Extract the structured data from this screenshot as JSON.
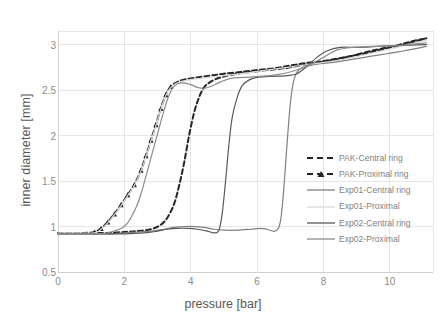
{
  "chart_data": {
    "type": "line",
    "title": "",
    "xlabel": "pressure [bar]",
    "ylabel": "inner diameter [mm]",
    "xlim": [
      0,
      11.3
    ],
    "ylim": [
      0.5,
      3.15
    ],
    "xticks": [
      0,
      2,
      4,
      6,
      8,
      10
    ],
    "xticklabels": [
      "0",
      "2",
      "4",
      "6",
      "8",
      "10"
    ],
    "yticks": [
      0.5,
      1,
      1.5,
      2,
      2.5,
      3
    ],
    "yticklabels": [
      "0.5",
      "1",
      "1.5",
      "2",
      "2.5",
      "3"
    ],
    "grid": true,
    "grid_axis": "both",
    "legend_position": "right-inside",
    "series": [
      {
        "name": "PAK-Central ring",
        "style": "dashed",
        "marker": "none",
        "color": "#262626",
        "points": [
          [
            0.0,
            0.93
          ],
          [
            0.5,
            0.93
          ],
          [
            1.0,
            0.93
          ],
          [
            1.5,
            0.93
          ],
          [
            2.0,
            0.94
          ],
          [
            2.4,
            0.95
          ],
          [
            2.8,
            0.97
          ],
          [
            3.1,
            1.02
          ],
          [
            3.3,
            1.1
          ],
          [
            3.5,
            1.25
          ],
          [
            3.65,
            1.45
          ],
          [
            3.8,
            1.7
          ],
          [
            3.95,
            2.0
          ],
          [
            4.1,
            2.25
          ],
          [
            4.25,
            2.42
          ],
          [
            4.4,
            2.53
          ],
          [
            4.55,
            2.58
          ],
          [
            4.75,
            2.62
          ],
          [
            5.0,
            2.65
          ],
          [
            5.4,
            2.68
          ],
          [
            5.8,
            2.7
          ],
          [
            6.3,
            2.72
          ],
          [
            6.8,
            2.74
          ],
          [
            7.3,
            2.77
          ],
          [
            7.8,
            2.8
          ],
          [
            8.3,
            2.83
          ],
          [
            8.8,
            2.87
          ],
          [
            9.3,
            2.92
          ],
          [
            9.8,
            2.96
          ],
          [
            10.3,
            3.0
          ],
          [
            10.7,
            3.04
          ],
          [
            11.1,
            3.07
          ]
        ]
      },
      {
        "name": "PAK-Proximal ring",
        "style": "dashed",
        "marker": "triangle",
        "color": "#262626",
        "points": [
          [
            0.0,
            0.93
          ],
          [
            0.4,
            0.93
          ],
          [
            0.8,
            0.93
          ],
          [
            1.1,
            0.94
          ],
          [
            1.3,
            0.98
          ],
          [
            1.5,
            1.05
          ],
          [
            1.7,
            1.14
          ],
          [
            1.9,
            1.24
          ],
          [
            2.1,
            1.35
          ],
          [
            2.3,
            1.46
          ],
          [
            2.5,
            1.62
          ],
          [
            2.65,
            1.78
          ],
          [
            2.8,
            1.95
          ],
          [
            2.95,
            2.12
          ],
          [
            3.1,
            2.3
          ],
          [
            3.25,
            2.45
          ],
          [
            3.4,
            2.54
          ],
          [
            3.6,
            2.59
          ],
          [
            3.85,
            2.62
          ],
          [
            4.2,
            2.64
          ],
          [
            4.6,
            2.66
          ],
          [
            5.0,
            2.68
          ],
          [
            5.5,
            2.7
          ],
          [
            6.0,
            2.72
          ],
          [
            6.5,
            2.74
          ],
          [
            7.0,
            2.77
          ],
          [
            7.5,
            2.8
          ],
          [
            8.0,
            2.82
          ],
          [
            8.6,
            2.86
          ],
          [
            9.2,
            2.9
          ],
          [
            9.8,
            2.95
          ],
          [
            10.4,
            3.0
          ],
          [
            11.1,
            3.07
          ]
        ]
      },
      {
        "name": "Exp01-Central ring",
        "style": "solid",
        "marker": "none",
        "color": "#808080",
        "points": [
          [
            0.0,
            0.92
          ],
          [
            1.0,
            0.92
          ],
          [
            1.6,
            0.92
          ],
          [
            2.0,
            0.93
          ],
          [
            2.4,
            0.94
          ],
          [
            2.8,
            0.95
          ],
          [
            3.2,
            0.97
          ],
          [
            3.5,
            0.99
          ],
          [
            3.8,
            1.0
          ],
          [
            4.1,
            1.0
          ],
          [
            4.4,
            0.99
          ],
          [
            4.7,
            0.97
          ],
          [
            5.0,
            0.96
          ],
          [
            5.4,
            0.96
          ],
          [
            5.8,
            0.97
          ],
          [
            6.1,
            0.98
          ],
          [
            6.3,
            0.97
          ],
          [
            6.55,
            0.95
          ],
          [
            6.7,
            1.05
          ],
          [
            6.8,
            1.4
          ],
          [
            6.9,
            1.9
          ],
          [
            7.0,
            2.35
          ],
          [
            7.1,
            2.6
          ],
          [
            7.25,
            2.72
          ],
          [
            7.5,
            2.76
          ],
          [
            7.9,
            2.79
          ],
          [
            8.4,
            2.81
          ],
          [
            8.9,
            2.84
          ],
          [
            9.4,
            2.87
          ],
          [
            9.9,
            2.9
          ],
          [
            10.4,
            2.93
          ],
          [
            11.1,
            2.98
          ]
        ]
      },
      {
        "name": "Exp01-Proximal",
        "style": "solid",
        "marker": "none",
        "color": "#d9d9d9",
        "points": [
          [
            0.0,
            0.93
          ],
          [
            0.6,
            0.93
          ],
          [
            1.1,
            0.93
          ],
          [
            1.3,
            0.97
          ],
          [
            1.5,
            1.04
          ],
          [
            1.7,
            1.13
          ],
          [
            1.9,
            1.23
          ],
          [
            2.1,
            1.34
          ],
          [
            2.3,
            1.45
          ],
          [
            2.5,
            1.61
          ],
          [
            2.65,
            1.77
          ],
          [
            2.8,
            1.94
          ],
          [
            2.95,
            2.11
          ],
          [
            3.1,
            2.29
          ],
          [
            3.25,
            2.44
          ],
          [
            3.4,
            2.53
          ],
          [
            3.6,
            2.58
          ],
          [
            3.9,
            2.61
          ],
          [
            4.3,
            2.63
          ],
          [
            4.8,
            2.65
          ],
          [
            5.3,
            2.67
          ],
          [
            5.9,
            2.7
          ],
          [
            6.5,
            2.73
          ],
          [
            7.1,
            2.76
          ],
          [
            7.7,
            2.79
          ],
          [
            8.3,
            2.82
          ],
          [
            8.9,
            2.86
          ],
          [
            9.5,
            2.91
          ],
          [
            10.2,
            2.97
          ],
          [
            11.1,
            3.05
          ]
        ]
      },
      {
        "name": "Exp02-Central ring",
        "style": "solid",
        "marker": "none",
        "color": "#595959",
        "points": [
          [
            0.0,
            0.92
          ],
          [
            1.0,
            0.92
          ],
          [
            2.0,
            0.92
          ],
          [
            2.6,
            0.93
          ],
          [
            3.0,
            0.95
          ],
          [
            3.3,
            0.97
          ],
          [
            3.6,
            0.98
          ],
          [
            3.9,
            0.98
          ],
          [
            4.2,
            0.97
          ],
          [
            4.5,
            0.95
          ],
          [
            4.7,
            0.93
          ],
          [
            4.85,
            0.96
          ],
          [
            4.95,
            1.15
          ],
          [
            5.05,
            1.5
          ],
          [
            5.15,
            1.9
          ],
          [
            5.25,
            2.2
          ],
          [
            5.4,
            2.42
          ],
          [
            5.55,
            2.55
          ],
          [
            5.75,
            2.61
          ],
          [
            6.0,
            2.64
          ],
          [
            6.4,
            2.65
          ],
          [
            6.9,
            2.66
          ],
          [
            7.2,
            2.68
          ],
          [
            7.5,
            2.76
          ],
          [
            7.8,
            2.86
          ],
          [
            8.1,
            2.93
          ],
          [
            8.5,
            2.97
          ],
          [
            9.0,
            2.97
          ],
          [
            9.6,
            2.98
          ],
          [
            10.2,
            2.99
          ],
          [
            11.1,
            3.0
          ]
        ]
      },
      {
        "name": "Exp02-Proximal",
        "style": "solid",
        "marker": "none",
        "color": "#8c8c8c",
        "points": [
          [
            0.0,
            0.92
          ],
          [
            1.2,
            0.92
          ],
          [
            1.6,
            0.94
          ],
          [
            2.0,
            1.0
          ],
          [
            2.2,
            1.1
          ],
          [
            2.4,
            1.25
          ],
          [
            2.55,
            1.42
          ],
          [
            2.7,
            1.62
          ],
          [
            2.85,
            1.82
          ],
          [
            3.0,
            2.02
          ],
          [
            3.15,
            2.22
          ],
          [
            3.3,
            2.4
          ],
          [
            3.45,
            2.52
          ],
          [
            3.6,
            2.57
          ],
          [
            3.8,
            2.58
          ],
          [
            4.0,
            2.56
          ],
          [
            4.2,
            2.53
          ],
          [
            4.4,
            2.52
          ],
          [
            4.6,
            2.54
          ],
          [
            4.9,
            2.59
          ],
          [
            5.2,
            2.63
          ],
          [
            5.6,
            2.64
          ],
          [
            6.1,
            2.65
          ],
          [
            6.6,
            2.67
          ],
          [
            7.1,
            2.71
          ],
          [
            7.6,
            2.78
          ],
          [
            8.0,
            2.86
          ],
          [
            8.4,
            2.94
          ],
          [
            8.9,
            2.97
          ],
          [
            9.5,
            2.98
          ],
          [
            10.2,
            2.99
          ],
          [
            11.1,
            3.02
          ]
        ]
      }
    ]
  },
  "legend": {
    "items": [
      {
        "label": "PAK-Central ring",
        "style": "dashed",
        "marker": "none",
        "color": "#262626"
      },
      {
        "label": "PAK-Proximal ring",
        "style": "dashed",
        "marker": "triangle",
        "color": "#262626"
      },
      {
        "label": "Exp01-Central ring",
        "style": "solid",
        "marker": "none",
        "color": "#808080"
      },
      {
        "label": "Exp01-Proximal",
        "style": "solid",
        "marker": "none",
        "color": "#d9d9d9"
      },
      {
        "label": "Exp02-Central ring",
        "style": "solid",
        "marker": "none",
        "color": "#595959"
      },
      {
        "label": "Exp02-Proximal",
        "style": "solid",
        "marker": "none",
        "color": "#8c8c8c"
      }
    ]
  },
  "colors": {
    "grid": "#e6e6e6",
    "tick_text": "#8c8c8c",
    "axis_title": "#595959",
    "background": "#ffffff"
  }
}
